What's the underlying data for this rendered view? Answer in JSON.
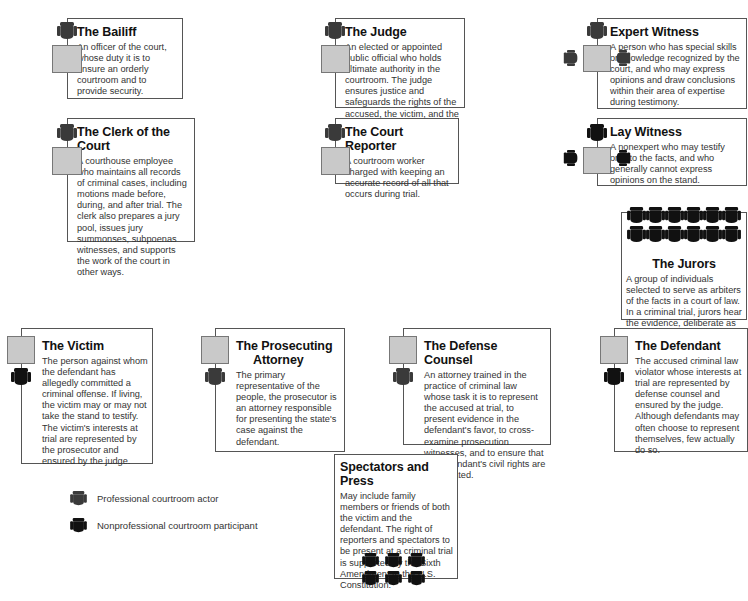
{
  "colors": {
    "professional_chair": "#3a3a3a",
    "nonprofessional_chair": "#111111",
    "desk": "#c9c9c9",
    "border": "#555555"
  },
  "roles": {
    "bailiff": {
      "title": "The Bailiff",
      "description": "An officer of the court, whose duty it is to ensure an orderly courtroom and to provide security.",
      "icon": "professional-chair-icon"
    },
    "clerk": {
      "title": "The Clerk of the Court",
      "description": "A courthouse employee who maintains all records of criminal cases, including motions made before, during, and after trial. The clerk also prepares a jury pool, issues jury summonses, subpoenas witnesses, and supports the work of the court in other ways.",
      "icon": "professional-chair-icon"
    },
    "judge": {
      "title": "The Judge",
      "description": "An elected or appointed public official who holds ultimate authority in the courtroom. The judge ensures justice and safeguards the rights of the accused, the victim, and the public.",
      "icon": "professional-chair-icon"
    },
    "court_reporter": {
      "title": "The Court Reporter",
      "description": "A courtroom worker charged with keeping an accurate record of all that occurs during trial.",
      "icon": "professional-chair-icon"
    },
    "expert_witness": {
      "title": "Expert Witness",
      "description": "A person who has special skills or knowledge recognized by the court, and who may express opinions and draw conclusions within their area of expertise during testimony.",
      "icon": "professional-chair-icon"
    },
    "lay_witness": {
      "title": "Lay Witness",
      "description": "A nonexpert who may testify only to the facts, and who generally cannot express opinions on the stand.",
      "icon": "nonprofessional-chair-icon"
    },
    "jurors": {
      "title": "The Jurors",
      "description": "A group of individuals selected to serve as arbiters of the facts in a court of law. In a criminal trial, jurors hear the evidence, deliberate as a group, and render a verdict.",
      "icon": "nonprofessional-chair-icon",
      "seat_count": 12
    },
    "victim": {
      "title": "The Victim",
      "description": "The person against whom the defendant has allegedly committed a criminal offense. If living, the victim may or may not take the stand to testify. The victim's interests at trial are represented by the prosecutor and ensured by the judge.",
      "icon": "nonprofessional-chair-icon"
    },
    "prosecutor": {
      "title": "The Prosecuting Attorney",
      "title_line1": "The Prosecuting",
      "title_line2": "Attorney",
      "description": "The primary representative of the people, the prosecutor is an attorney responsible for presenting the state's case against the defendant.",
      "icon": "professional-chair-icon"
    },
    "defense": {
      "title": "The Defense Counsel",
      "description": "An attorney trained in the practice of criminal law whose task it is to represent the accused at trial, to present evidence in the defendant's favor, to cross-examine prosecution witnesses, and to ensure that the defendant's civil rights are not violated.",
      "icon": "professional-chair-icon"
    },
    "defendant": {
      "title": "The Defendant",
      "description": "The accused criminal law violator whose interests at trial are represented by defense counsel and ensured by the judge. Although defendants may often choose to represent themselves, few actually do so.",
      "icon": "nonprofessional-chair-icon"
    },
    "spectators": {
      "title": "Spectators and Press",
      "description": "May include family members or friends of both the victim and the defendant. The right of reporters and spectators to be present at a criminal trial is supported by the Sixth Amendment to the U.S. Constitution.",
      "icon": "nonprofessional-chair-icon",
      "seat_count": 6
    }
  },
  "legend": {
    "professional": "Professional courtroom actor",
    "nonprofessional": "Nonprofessional courtroom participant"
  }
}
